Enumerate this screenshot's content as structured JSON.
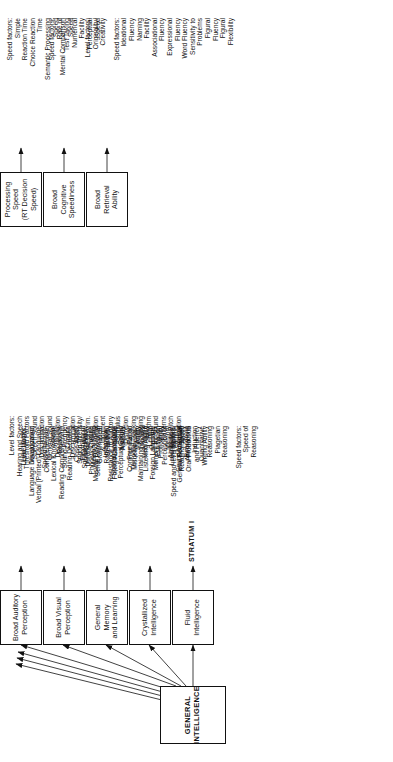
{
  "figure": {
    "line_color": "#111111",
    "background": "#ffffff"
  },
  "strata_labels": [
    {
      "id": "stratum-iii",
      "label": "STRATUM III"
    },
    {
      "id": "stratum-ii",
      "label": "STRATUM II"
    },
    {
      "id": "stratum-i",
      "label": "STRATUM I"
    }
  ],
  "general": {
    "id": "general-intelligence",
    "label": "GENERAL\nINTELLIGENCE"
  },
  "broad_abilities": [
    {
      "id": "fluid-intelligence",
      "label": "Fluid\nIntelligence"
    },
    {
      "id": "crystallized-intelligence",
      "label": "Crystallized\nIntelligence"
    },
    {
      "id": "general-memory-learning",
      "label": "General Memory\nand Learning"
    },
    {
      "id": "broad-visual-perception",
      "label": "Broad Visual\nPerception"
    },
    {
      "id": "broad-auditory-perception",
      "label": "Broad Auditory\nPerception"
    },
    {
      "id": "broad-retrieval-ability",
      "label": "Broad Retrieval\nAbility"
    },
    {
      "id": "broad-cognitive-speediness",
      "label": "Broad Cognitive\nSpeediness"
    },
    {
      "id": "processing-speed",
      "label": "Processing Speed\n(RT Decision Speed)"
    }
  ],
  "narrow_abilities": [
    {
      "parent": "fluid-intelligence",
      "groups": [
        {
          "heading": "Level factors:",
          "items": [
            "General Sequential",
            "Reasoning",
            "Induction",
            "Quantitative",
            "Reasoning",
            "Piagetian",
            "Reasoning"
          ]
        },
        {
          "heading": "Speed factors:",
          "items": [
            "Speed of",
            "Reasoning"
          ]
        }
      ]
    },
    {
      "parent": "crystallized-intelligence",
      "groups": [
        {
          "heading": "Level factors:",
          "items": [
            "Language Development",
            "Verbal (Printed) Language",
            "Comprehension",
            "Lexical Knowledge",
            "Reading Comprehension",
            "Reading Decoding",
            "Close Ability",
            "Spelling Ability",
            "Phonetic Coding",
            "Grammatical",
            "Sensitivity",
            "Foreign Language",
            "Aptitude",
            "Communication",
            "Ability",
            "Listening Ability",
            "Foreign Language",
            "Proficiency"
          ]
        },
        {
          "heading": "Speed and level factors:",
          "items": [
            "Reading Speed",
            "Oral Production",
            "and Fluency",
            "Writing Ability"
          ]
        }
      ]
    },
    {
      "parent": "general-memory-learning",
      "groups": [
        {
          "heading": "Level factor:",
          "items": [
            "Memory Span"
          ]
        },
        {
          "heading": "Rate factors:",
          "items": [
            "Associative",
            "Memory",
            "Free Recall",
            "Memory",
            "Meaningful",
            "Memory",
            "Visual",
            "Memory",
            "Learning",
            "Ability"
          ]
        }
      ]
    },
    {
      "parent": "broad-visual-perception",
      "groups": [
        {
          "heading": "Level factor:",
          "items": [
            "Visualization"
          ]
        },
        {
          "heading": "Speed factors:",
          "items": [
            "Spatial",
            "Relations",
            "Closure",
            "Speed",
            "Flexibility of",
            "Closure",
            "Serial Perceptual",
            "Integration",
            "Spatial Scanning",
            "Perceptual Speed"
          ]
        },
        {
          "heading": "Miscellaneous:",
          "items": [
            "Imagery",
            "Length",
            "Estimation",
            "Perception of",
            "Illusions",
            "Perceptual",
            "Alternations"
          ]
        }
      ]
    },
    {
      "parent": "broad-auditory-perception",
      "groups": [
        {
          "heading": "Level factors:",
          "items": [
            "Hearing and Speech",
            "Threshold Factors",
            "Speech Sound",
            "Discrimination",
            "General Sound",
            "Discrimination",
            "Sound-Frequency",
            "Discrimination",
            "Sound-Intensity/",
            "Duration Discrim.",
            "Musical Discrimination",
            "& Judgment",
            "Resistance to Auditory",
            "Stimulus",
            "Distortion",
            "Temporal Tracking",
            "Maintaining & Judging",
            "Rhythm",
            "Memory for Sound",
            "Patterns",
            "Absolute Pitch",
            "Sound Localization"
          ]
        }
      ]
    },
    {
      "parent": "broad-retrieval-ability",
      "groups": [
        {
          "heading": "Level factors:",
          "items": [
            "Originality/",
            "Creativity"
          ]
        },
        {
          "heading": "Speed factors:",
          "items": [
            "Ideational",
            "Fluency",
            "Naming",
            "Facility",
            "Associational",
            "Fluency",
            "Expressional",
            "Fluency",
            "Word Fluency",
            "Sensitivity to",
            "Problems",
            "Figural",
            "Fluency",
            "Figural",
            "Flexibility"
          ]
        }
      ]
    },
    {
      "parent": "broad-cognitive-speediness",
      "groups": [
        {
          "heading": "Speed factors:",
          "items": [
            "Rate of",
            "Test Taking",
            "Numerical",
            "Facility",
            "Perceptual",
            "Speed"
          ]
        }
      ]
    },
    {
      "parent": "processing-speed",
      "groups": [
        {
          "heading": "Speed factors:",
          "items": [
            "Simple",
            "Reaction Time",
            "Choice Reaction",
            "Time",
            "Semantic Processing",
            "Speed",
            "Mental Comparison",
            "Speed"
          ]
        }
      ]
    }
  ]
}
